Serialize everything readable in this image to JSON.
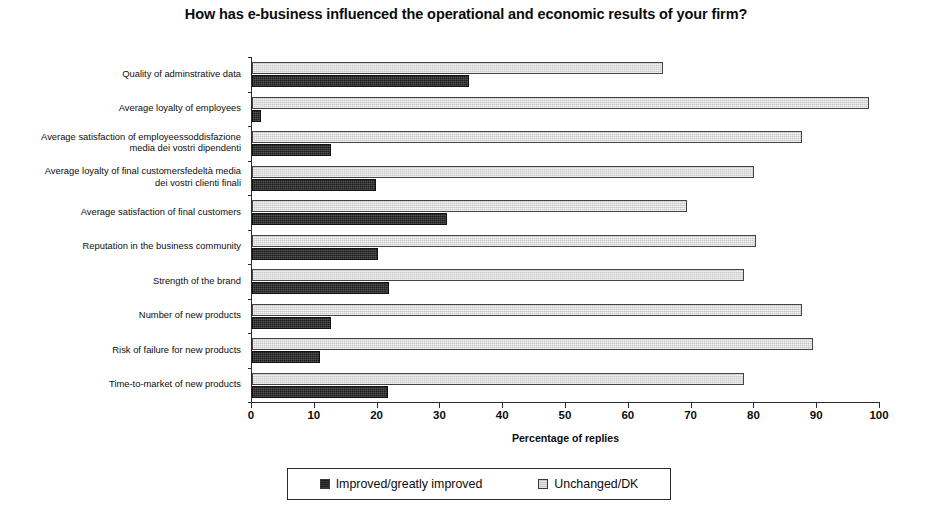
{
  "chart_data": {
    "type": "bar",
    "orientation": "horizontal",
    "title": "How has e-business influenced the operational and economic results of your firm?",
    "xlabel": "Percentage of replies",
    "ylabel": "",
    "xlim": [
      0,
      100
    ],
    "xticks": [
      0,
      10,
      20,
      30,
      40,
      50,
      60,
      70,
      80,
      90,
      100
    ],
    "xtick_labels": [
      "0",
      "10",
      "20",
      "30",
      "40",
      "50",
      "60",
      "70",
      "80",
      "90",
      "100"
    ],
    "grid": false,
    "legend_position": "bottom",
    "categories": [
      "Quality of adminstrative data",
      "Average loyalty of employees",
      "Average satisfaction of employeessoddisfazione media dei vostri dipendenti",
      "Average loyalty of final customersfedeltà media dei vostri clienti finali",
      "Average satisfaction of final customers",
      "Reputation in the business community",
      "Strength of the brand",
      "Number of new products",
      "Risk of failure for new products",
      "Time-to-market of new products"
    ],
    "category_lines": [
      [
        "Quality of adminstrative data"
      ],
      [
        "Average loyalty of employees"
      ],
      [
        "Average satisfaction of employeessoddisfazione",
        "media dei vostri dipendenti"
      ],
      [
        "Average loyalty of final customersfedeltà media",
        "dei vostri clienti finali"
      ],
      [
        "Average satisfaction of final customers"
      ],
      [
        "Reputation in the business community"
      ],
      [
        "Strength of the brand"
      ],
      [
        "Number of new products"
      ],
      [
        "Risk of failure for new products"
      ],
      [
        "Time-to-market of new products"
      ]
    ],
    "series": [
      {
        "name": "Improved/greatly improved",
        "color": "#1c1c1c",
        "values": [
          34.5,
          1.5,
          12.5,
          19.8,
          31.0,
          20.0,
          21.8,
          12.5,
          10.8,
          21.7
        ]
      },
      {
        "name": "Unchanged/DK",
        "color": "#c9c9c9",
        "values": [
          65.4,
          98.2,
          87.5,
          80.0,
          69.2,
          80.2,
          78.3,
          87.5,
          89.3,
          78.4
        ]
      }
    ]
  },
  "legend": {
    "items": [
      {
        "label": "Improved/greatly improved",
        "swatch": "dark"
      },
      {
        "label": "Unchanged/DK",
        "swatch": "light"
      }
    ]
  }
}
